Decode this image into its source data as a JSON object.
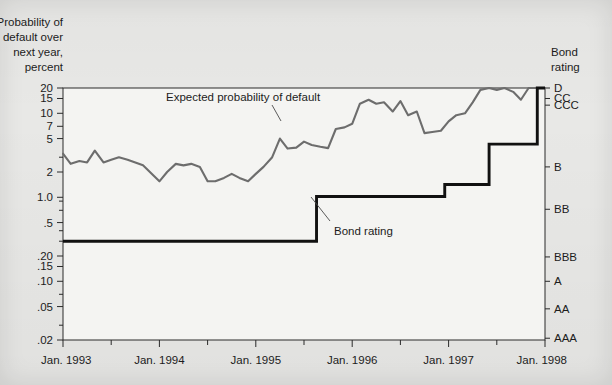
{
  "figure": {
    "left_axis_title_lines": [
      "Probability of",
      "default over",
      "next year,",
      "percent"
    ],
    "right_axis_title_lines": [
      "Bond",
      "rating"
    ],
    "series_labels": {
      "pd": "Expected probability of default",
      "rating": "Bond rating"
    }
  },
  "chart_data": {
    "type": "line",
    "title": "",
    "subtitle": "",
    "xlabel": "",
    "ylabel": "Probability of default over next year, percent",
    "y2label": "Bond rating",
    "yscale": "log",
    "ylim": [
      0.02,
      20
    ],
    "grid": false,
    "legend_position": "inline-annotations",
    "xlim": [
      "Jan. 1993",
      "Jan. 1998"
    ],
    "xtick_labels": [
      "Jan. 1993",
      "Jan. 1994",
      "Jan. 1995",
      "Jan. 1996",
      "Jan. 1997",
      "Jan. 1998"
    ],
    "xtick_minor": "half-year ticks between labeled years",
    "ytick_labels": [
      "20",
      "15",
      "10",
      "7",
      "5",
      "2",
      "1.0",
      ".5",
      ".20",
      ".15",
      ".10",
      ".05",
      ".02"
    ],
    "ytick_values": [
      20,
      15,
      10,
      7,
      5,
      2,
      1.0,
      0.5,
      0.2,
      0.15,
      0.1,
      0.05,
      0.02
    ],
    "y2tick_labels": [
      "D",
      "CC",
      "CCC",
      "B",
      "BB",
      "BBB",
      "A",
      "AA",
      "AAA"
    ],
    "y2tick_values": [
      20,
      15,
      12.5,
      2.3,
      0.72,
      0.195,
      0.1,
      0.047,
      0.021
    ],
    "series": [
      {
        "name": "Expected probability of default",
        "color": "#6d6d6d",
        "x": [
          1993.0,
          1993.08,
          1993.17,
          1993.25,
          1993.33,
          1993.42,
          1993.5,
          1993.58,
          1993.67,
          1993.75,
          1993.83,
          1993.92,
          1994.0,
          1994.08,
          1994.17,
          1994.25,
          1994.33,
          1994.42,
          1994.5,
          1994.58,
          1994.67,
          1994.75,
          1994.83,
          1994.92,
          1995.0,
          1995.08,
          1995.17,
          1995.25,
          1995.33,
          1995.42,
          1995.5,
          1995.58,
          1995.67,
          1995.75,
          1995.83,
          1995.92,
          1996.0,
          1996.08,
          1996.17,
          1996.25,
          1996.33,
          1996.42,
          1996.5,
          1996.58,
          1996.67,
          1996.75,
          1996.83,
          1996.92,
          1997.0,
          1997.08,
          1997.17,
          1997.25,
          1997.33,
          1997.42,
          1997.5,
          1997.58,
          1997.67,
          1997.75,
          1997.83,
          1997.92,
          1998.0
        ],
        "values": [
          3.3,
          2.5,
          2.7,
          2.6,
          3.6,
          2.6,
          2.8,
          3.0,
          2.8,
          2.6,
          2.4,
          1.9,
          1.55,
          2.0,
          2.5,
          2.4,
          2.5,
          2.3,
          1.55,
          1.55,
          1.7,
          1.9,
          1.7,
          1.55,
          1.9,
          2.3,
          3.0,
          5.0,
          3.8,
          3.9,
          4.6,
          4.2,
          4.0,
          3.85,
          6.5,
          6.8,
          7.5,
          13.0,
          14.5,
          13.0,
          13.5,
          10.5,
          14.0,
          9.5,
          10.5,
          5.8,
          6.0,
          6.2,
          8.0,
          9.5,
          10.0,
          13.5,
          19.0,
          20.0,
          19.0,
          20.5,
          18.0,
          14.5,
          20.0,
          20.0,
          20.0
        ]
      },
      {
        "name": "Bond rating",
        "color": "#111111",
        "steps": [
          {
            "x": 1993.0,
            "rating": "BBB",
            "value": 0.3
          },
          {
            "x": 1995.63,
            "rating": "BB",
            "value": 1.02
          },
          {
            "x": 1996.96,
            "rating": "BB+",
            "value": 1.42
          },
          {
            "x": 1997.42,
            "rating": "B",
            "value": 4.3
          },
          {
            "x": 1997.92,
            "rating": "CCC",
            "value": 20.0
          },
          {
            "x": 1998.0,
            "rating": "CCC",
            "value": 20.0
          }
        ]
      }
    ]
  }
}
